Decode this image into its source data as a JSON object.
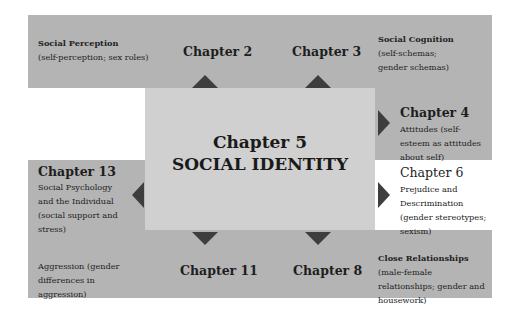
{
  "center": {
    "chapter": "Chapter 5",
    "title": "SOCIAL IDENTITY"
  },
  "chapters": {
    "ch2": {
      "label": "Chapter 2",
      "topic": "Social Perception",
      "detail": "(self-perception; sex roles)"
    },
    "ch3": {
      "label": "Chapter 3",
      "topic": "Social Cognition",
      "detail": "(self-schemas; gender schemas)"
    },
    "ch4": {
      "label": "Chapter 4",
      "topic": "Attitudes (self-esteem as attitudes about self)"
    },
    "ch6": {
      "label": "Chapter 6",
      "topic": "Prejudice and Descrimination (gender stereotypes; sexism)"
    },
    "ch13": {
      "label": "Chapter 13",
      "topic": "Social Psychology and the Individual (social support and stress)"
    },
    "ch11": {
      "label": "Chapter 11",
      "topic": "Aggression (gender differences in aggression)"
    },
    "ch8": {
      "label": "Chapter 8",
      "topic": "Close Relationships",
      "detail": "(male-female relationships; gender and housework)"
    }
  },
  "colors": {
    "outer_panel": "#b4b4b4",
    "center_panel": "#d0d0d0",
    "arrow": "#3e3e3e"
  }
}
